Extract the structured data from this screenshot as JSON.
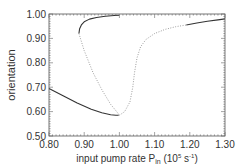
{
  "chart_data": {
    "type": "line",
    "title": "",
    "xlabel": "input pump rate P_in (10^5 s^-1)",
    "xlabel_parts": {
      "main": "input pump rate P",
      "sub": "in",
      "pre_sup": " (10",
      "sup1": "5",
      "mid": " s",
      "sup2": "-1",
      "end": ")"
    },
    "ylabel": "orientation",
    "xlim": [
      0.8,
      1.3
    ],
    "ylim": [
      0.5,
      1.0
    ],
    "xticks": [
      "0.80",
      "0.90",
      "1.00",
      "1.10",
      "1.20",
      "1.30"
    ],
    "yticks": [
      "0.50",
      "0.60",
      "0.70",
      "0.80",
      "0.90",
      "1.00"
    ],
    "grid": false,
    "legend": null,
    "series": [
      {
        "name": "stable upper branch (left)",
        "style": "solid",
        "x": [
          0.885,
          0.887,
          0.892,
          0.9,
          0.915,
          0.935,
          0.96,
          0.985,
          1.0
        ],
        "y": [
          0.92,
          0.94,
          0.955,
          0.968,
          0.979,
          0.986,
          0.991,
          0.994,
          0.995
        ]
      },
      {
        "name": "unstable branch (left)",
        "style": "dotted",
        "x": [
          0.885,
          0.9,
          0.925,
          0.95,
          0.975,
          0.995,
          1.0
        ],
        "y": [
          0.92,
          0.85,
          0.76,
          0.69,
          0.63,
          0.595,
          0.585
        ]
      },
      {
        "name": "stable lower branch",
        "style": "solid",
        "x": [
          0.8,
          0.84,
          0.88,
          0.92,
          0.95,
          0.975,
          0.99,
          0.998
        ],
        "y": [
          0.695,
          0.665,
          0.635,
          0.61,
          0.595,
          0.587,
          0.585,
          0.585
        ]
      },
      {
        "name": "unstable branch (right)",
        "style": "dotted",
        "x": [
          1.0,
          1.015,
          1.03,
          1.038,
          1.043,
          1.05,
          1.06,
          1.075,
          1.1,
          1.13,
          1.16,
          1.19
        ],
        "y": [
          0.585,
          0.6,
          0.64,
          0.7,
          0.76,
          0.82,
          0.865,
          0.895,
          0.92,
          0.937,
          0.948,
          0.955
        ]
      },
      {
        "name": "stable upper branch (right)",
        "style": "solid",
        "x": [
          1.19,
          1.22,
          1.25,
          1.28,
          1.3
        ],
        "y": [
          0.955,
          0.963,
          0.97,
          0.976,
          0.98
        ]
      }
    ]
  }
}
